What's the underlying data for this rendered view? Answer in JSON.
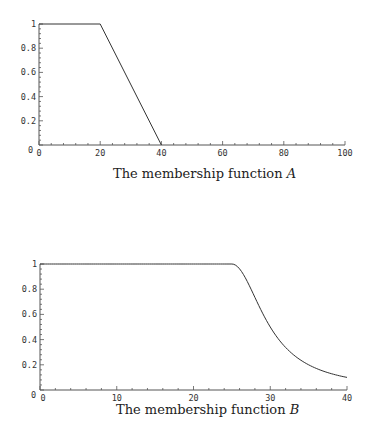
{
  "chart_data": [
    {
      "type": "line",
      "title": "The membership function A",
      "caption_text": "The membership function ",
      "caption_var": "A",
      "xlabel": "",
      "ylabel": "",
      "xlim": [
        0,
        100
      ],
      "ylim": [
        0,
        1
      ],
      "xticks": [
        0,
        20,
        40,
        60,
        80,
        100
      ],
      "yticks": [
        0.2,
        0.4,
        0.6,
        0.8,
        1
      ],
      "ytick_labels": [
        "0",
        "0.2",
        "0.4",
        "0.6",
        "0.8",
        "1"
      ],
      "grid": false,
      "series": [
        {
          "name": "A",
          "x": [
            0,
            20,
            40
          ],
          "y": [
            1,
            1,
            0
          ]
        }
      ]
    },
    {
      "type": "line",
      "title": "The membership function B",
      "caption_text": "The membership function ",
      "caption_var": "B",
      "xlabel": "",
      "ylabel": "",
      "xlim": [
        0,
        40
      ],
      "ylim": [
        0,
        1
      ],
      "xticks": [
        0,
        10,
        20,
        30,
        40
      ],
      "yticks": [
        0.2,
        0.4,
        0.6,
        0.8,
        1
      ],
      "ytick_labels": [
        "0",
        "0.2",
        "0.4",
        "0.6",
        "0.8",
        "1"
      ],
      "grid": false,
      "series": [
        {
          "name": "B",
          "x": [
            0,
            25,
            26,
            27,
            28,
            29,
            30,
            31,
            32,
            33,
            34,
            35,
            36,
            37,
            38,
            39,
            40
          ],
          "y": [
            1,
            1,
            0.96,
            0.86,
            0.74,
            0.61,
            0.5,
            0.41,
            0.34,
            0.28,
            0.24,
            0.2,
            0.17,
            0.15,
            0.13,
            0.11,
            0.1
          ]
        }
      ]
    }
  ],
  "layout": [
    {
      "x0": 39,
      "x1": 345,
      "y0": 145,
      "y1": 24,
      "caption_x": 113,
      "caption_y": 166
    },
    {
      "x0": 40,
      "x1": 347,
      "y0": 390,
      "y1": 264,
      "caption_x": 116,
      "caption_y": 402
    }
  ]
}
